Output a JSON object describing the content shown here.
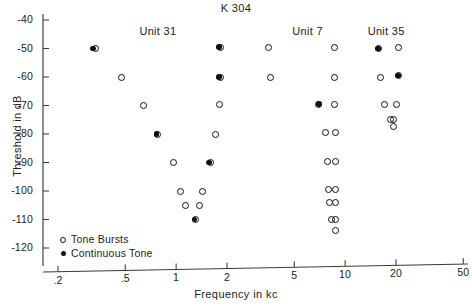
{
  "chart_data": {
    "type": "scatter",
    "title": "K 304",
    "xlabel": "Frequency in kc",
    "ylabel": "Threshold in dB",
    "xscale": "log",
    "xlim": [
      0.2,
      50
    ],
    "ylim": [
      -124,
      -36
    ],
    "xticks": [
      0.2,
      0.5,
      1,
      2,
      5,
      10,
      20,
      50
    ],
    "xtick_labels": [
      ".2",
      ".5",
      "1",
      "2",
      "5",
      "10",
      "20",
      "50"
    ],
    "yticks": [
      -40,
      -50,
      -60,
      -70,
      -80,
      -90,
      -100,
      -110,
      -120
    ],
    "ytick_labels": [
      "-40",
      "-50",
      "-60",
      "-70",
      "-80",
      "-90",
      "-100",
      "-110",
      "-120"
    ],
    "grid": false,
    "legend_position": "lower-left",
    "legend": [
      {
        "marker": "open-circle",
        "label": "Tone Bursts"
      },
      {
        "marker": "filled-circle",
        "label": "Continuous Tone"
      }
    ],
    "annotations": [
      {
        "text": "Unit 31",
        "x": 0.78,
        "y": -44.5
      },
      {
        "text": "Unit 7",
        "x": 6.0,
        "y": -44.5
      },
      {
        "text": "Unit 35",
        "x": 17.5,
        "y": -44.5
      }
    ],
    "series": [
      {
        "name": "Tone Bursts",
        "marker": "open-circle",
        "points": [
          {
            "unit": "Unit 31",
            "x": 0.335,
            "y": -50
          },
          {
            "unit": "Unit 31",
            "x": 0.475,
            "y": -60
          },
          {
            "unit": "Unit 31",
            "x": 0.64,
            "y": -70
          },
          {
            "unit": "Unit 31",
            "x": 0.78,
            "y": -80
          },
          {
            "unit": "Unit 31",
            "x": 0.97,
            "y": -90
          },
          {
            "unit": "Unit 31",
            "x": 1.06,
            "y": -100
          },
          {
            "unit": "Unit 31",
            "x": 1.13,
            "y": -105
          },
          {
            "unit": "Unit 31",
            "x": 1.3,
            "y": -110
          },
          {
            "unit": "Unit 31",
            "x": 1.38,
            "y": -105
          },
          {
            "unit": "Unit 31",
            "x": 1.44,
            "y": -100
          },
          {
            "unit": "Unit 31",
            "x": 1.6,
            "y": -90
          },
          {
            "unit": "Unit 31",
            "x": 1.72,
            "y": -80
          },
          {
            "unit": "Unit 31",
            "x": 1.8,
            "y": -69.5
          },
          {
            "unit": "Unit 31",
            "x": 1.84,
            "y": -60
          },
          {
            "unit": "Unit 31",
            "x": 1.82,
            "y": -49.5
          },
          {
            "unit": "Unit 7",
            "x": 3.5,
            "y": -49.5
          },
          {
            "unit": "Unit 7",
            "x": 3.62,
            "y": -60
          },
          {
            "unit": "Unit 7",
            "x": 6.95,
            "y": -69.5
          },
          {
            "unit": "Unit 7",
            "x": 7.7,
            "y": -79.5
          },
          {
            "unit": "Unit 7",
            "x": 7.9,
            "y": -89.5
          },
          {
            "unit": "Unit 7",
            "x": 7.95,
            "y": -99.5
          },
          {
            "unit": "Unit 7",
            "x": 8.05,
            "y": -104
          },
          {
            "unit": "Unit 7",
            "x": 8.25,
            "y": -110
          },
          {
            "unit": "Unit 7",
            "x": 8.75,
            "y": -110
          },
          {
            "unit": "Unit 7",
            "x": 8.72,
            "y": -114
          },
          {
            "unit": "Unit 7",
            "x": 8.8,
            "y": -104
          },
          {
            "unit": "Unit 7",
            "x": 8.8,
            "y": -99.5
          },
          {
            "unit": "Unit 7",
            "x": 8.75,
            "y": -89.5
          },
          {
            "unit": "Unit 7",
            "x": 8.72,
            "y": -79.5
          },
          {
            "unit": "Unit 7",
            "x": 8.6,
            "y": -69.5
          },
          {
            "unit": "Unit 7",
            "x": 8.6,
            "y": -60
          },
          {
            "unit": "Unit 7",
            "x": 8.6,
            "y": -49.5
          },
          {
            "unit": "Unit 35",
            "x": 15.8,
            "y": -50
          },
          {
            "unit": "Unit 35",
            "x": 16.3,
            "y": -60
          },
          {
            "unit": "Unit 35",
            "x": 17.0,
            "y": -69.5
          },
          {
            "unit": "Unit 35",
            "x": 18.6,
            "y": -75
          },
          {
            "unit": "Unit 35",
            "x": 19.4,
            "y": -75
          },
          {
            "unit": "Unit 35",
            "x": 19.2,
            "y": -77.5
          },
          {
            "unit": "Unit 35",
            "x": 20.2,
            "y": -69.5
          },
          {
            "unit": "Unit 35",
            "x": 20.8,
            "y": -59.5
          },
          {
            "unit": "Unit 35",
            "x": 20.8,
            "y": -49.5
          }
        ]
      },
      {
        "name": "Continuous Tone",
        "marker": "filled-circle",
        "points": [
          {
            "unit": "Unit 31",
            "x": 0.322,
            "y": -50
          },
          {
            "unit": "Unit 31",
            "x": 0.765,
            "y": -80
          },
          {
            "unit": "Unit 31",
            "x": 1.285,
            "y": -110
          },
          {
            "unit": "Unit 31",
            "x": 1.565,
            "y": -90
          },
          {
            "unit": "Unit 31",
            "x": 1.795,
            "y": -60
          },
          {
            "unit": "Unit 31",
            "x": 1.795,
            "y": -49.5
          },
          {
            "unit": "Unit 7",
            "x": 7.0,
            "y": -69.5
          },
          {
            "unit": "Unit 35",
            "x": 15.7,
            "y": -50
          },
          {
            "unit": "Unit 35",
            "x": 20.6,
            "y": -59.5
          }
        ]
      }
    ]
  },
  "axes": {
    "x_pixel_of_02": 58,
    "px_per_decade": 169,
    "y_pixel_of_minus40": 20,
    "px_per_db": 2.85
  }
}
